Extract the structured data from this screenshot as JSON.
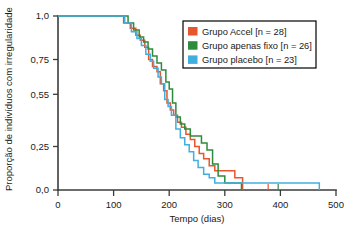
{
  "chart_data": {
    "type": "line",
    "title": "",
    "xlabel": "Tempo (dias)",
    "ylabel": "Proporção de indivíduos com irregularidade",
    "xlim": [
      0,
      500
    ],
    "ylim": [
      0.0,
      1.0
    ],
    "xticks": [
      0,
      100,
      200,
      300,
      400,
      500
    ],
    "xtick_labels": [
      "0",
      "100",
      "200",
      "300",
      "400",
      "500"
    ],
    "yticks": [
      0.0,
      0.25,
      0.55,
      0.75,
      1.0
    ],
    "ytick_labels": [
      "0,0",
      "0,25",
      "0,55",
      "0,75",
      "1,0"
    ],
    "grid": false,
    "legend_position": "upper right",
    "curve_style": "step-post",
    "series": [
      {
        "name": "Grupo Accel [n = 28]",
        "color": "#E8562D",
        "n": 28,
        "x": [
          0,
          92,
          118,
          130,
          140,
          148,
          156,
          163,
          170,
          178,
          184,
          190,
          196,
          202,
          208,
          215,
          222,
          230,
          238,
          246,
          254,
          262,
          272,
          282,
          300,
          318,
          332
        ],
        "y": [
          1.0,
          1.0,
          0.96,
          0.93,
          0.89,
          0.86,
          0.82,
          0.75,
          0.71,
          0.68,
          0.61,
          0.57,
          0.5,
          0.46,
          0.43,
          0.39,
          0.36,
          0.32,
          0.29,
          0.25,
          0.21,
          0.18,
          0.14,
          0.11,
          0.11,
          0.07,
          0.04
        ]
      },
      {
        "name": "Grupo apenas fixo [n = 26]",
        "color": "#2E8B3C",
        "n": 26,
        "x": [
          0,
          112,
          126,
          136,
          146,
          154,
          162,
          170,
          178,
          186,
          194,
          200,
          206,
          212,
          220,
          228,
          238,
          248,
          258,
          268,
          278,
          288,
          300,
          316,
          330
        ],
        "y": [
          1.0,
          1.0,
          0.96,
          0.92,
          0.88,
          0.85,
          0.81,
          0.77,
          0.73,
          0.69,
          0.62,
          0.58,
          0.5,
          0.42,
          0.38,
          0.35,
          0.31,
          0.31,
          0.27,
          0.23,
          0.15,
          0.08,
          0.04,
          0.04,
          0.04
        ]
      },
      {
        "name": "Grupo placebo [n = 23]",
        "color": "#41AEE0",
        "n": 23,
        "x": [
          0,
          96,
          120,
          132,
          142,
          150,
          158,
          166,
          172,
          180,
          186,
          192,
          198,
          204,
          212,
          220,
          228,
          236,
          244,
          252,
          262,
          272,
          282,
          340,
          400,
          470
        ],
        "y": [
          1.0,
          1.0,
          0.96,
          0.91,
          0.87,
          0.83,
          0.78,
          0.74,
          0.7,
          0.65,
          0.61,
          0.52,
          0.48,
          0.43,
          0.35,
          0.3,
          0.26,
          0.22,
          0.17,
          0.13,
          0.09,
          0.07,
          0.04,
          0.04,
          0.04,
          0.04
        ]
      }
    ],
    "censor_marks": [
      {
        "x": 378,
        "y": 0.0,
        "color": "#E8562D"
      },
      {
        "x": 396,
        "y": 0.0,
        "color": "#2E8B3C"
      }
    ]
  },
  "legend": {
    "entries": [
      {
        "label": "Grupo Accel [n = 28]",
        "color": "#E8562D"
      },
      {
        "label": "Grupo apenas fixo [n = 26]",
        "color": "#2E8B3C"
      },
      {
        "label": "Grupo placebo [n = 23]",
        "color": "#41AEE0"
      }
    ]
  }
}
